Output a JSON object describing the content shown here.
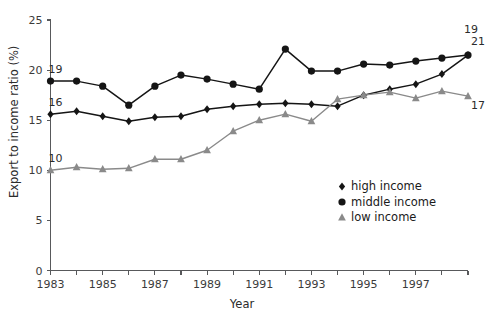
{
  "chart_data": {
    "type": "line",
    "title": "",
    "subtitle": "",
    "xlabel": "Year",
    "ylabel": "Export to income ratio (%)",
    "x": [
      1983,
      1984,
      1985,
      1986,
      1987,
      1988,
      1989,
      1990,
      1991,
      1992,
      1993,
      1994,
      1995,
      1996,
      1997,
      1998,
      1999
    ],
    "xtick_labels": [
      "1983",
      "1985",
      "1987",
      "1989",
      "1991",
      "1993",
      "1995",
      "1997"
    ],
    "xtick_values": [
      1983,
      1985,
      1987,
      1989,
      1991,
      1993,
      1995,
      1997
    ],
    "ytick_labels": [
      "0",
      "5",
      "10",
      "15",
      "20",
      "25"
    ],
    "ytick_values": [
      0,
      5,
      10,
      15,
      20,
      25
    ],
    "xlim": [
      1983,
      1999
    ],
    "ylim": [
      0,
      25
    ],
    "grid": false,
    "legend_position": "center-right",
    "series": [
      {
        "name": "high income",
        "marker": "diamond",
        "color": "#151515",
        "values": [
          15.6,
          15.9,
          15.4,
          14.9,
          15.3,
          15.4,
          16.1,
          16.4,
          16.6,
          16.7,
          16.6,
          16.4,
          17.5,
          18.1,
          18.6,
          19.6,
          21.5
        ]
      },
      {
        "name": "middle income",
        "marker": "circle",
        "color": "#151515",
        "values": [
          18.9,
          18.9,
          18.4,
          16.5,
          18.4,
          19.5,
          19.1,
          18.6,
          18.1,
          22.1,
          19.9,
          19.9,
          20.6,
          20.5,
          20.9,
          21.2,
          21.5
        ]
      },
      {
        "name": "low income",
        "marker": "triangle",
        "color": "#8a8a8a",
        "values": [
          10.0,
          10.3,
          10.1,
          10.2,
          11.1,
          11.1,
          12.0,
          13.9,
          15.0,
          15.6,
          14.9,
          17.1,
          17.5,
          17.8,
          17.2,
          17.9,
          17.4
        ]
      }
    ],
    "annotations": [
      {
        "text": "19",
        "series": "middle income",
        "position": "start-above",
        "value": 19
      },
      {
        "text": "16",
        "series": "high income",
        "position": "start-above",
        "value": 16
      },
      {
        "text": "10",
        "series": "low income",
        "position": "start-above",
        "value": 10
      },
      {
        "text": "21",
        "series": "middle income",
        "position": "end-above",
        "value": 21
      },
      {
        "text": "19",
        "series": "high income",
        "position": "end-above",
        "value": 19
      },
      {
        "text": "17",
        "series": "low income",
        "position": "end-below",
        "value": 17
      }
    ]
  },
  "legend": {
    "items": [
      {
        "label": "high income",
        "marker": "diamond",
        "color": "#151515"
      },
      {
        "label": "middle income",
        "marker": "circle",
        "color": "#151515"
      },
      {
        "label": "low income",
        "marker": "triangle",
        "color": "#8a8a8a"
      }
    ]
  },
  "axes": {
    "y_title": "Export to income ratio (%)",
    "x_title": "Year",
    "y_ticks": [
      "25",
      "20",
      "15",
      "10",
      "5",
      "0"
    ],
    "x_ticks": [
      "1983",
      "1985",
      "1987",
      "1989",
      "1991",
      "1993",
      "1995",
      "1997"
    ]
  },
  "annotations": {
    "start_middle": "19",
    "start_high": "16",
    "start_low": "10",
    "end_middle": "21",
    "end_high": "19",
    "end_low": "17"
  }
}
